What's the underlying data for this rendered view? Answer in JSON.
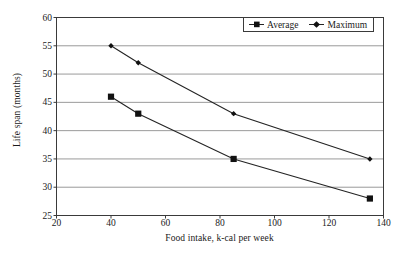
{
  "chart_data": {
    "type": "line",
    "title": "",
    "xlabel": "Food intake, k-cal per week",
    "ylabel": "Life span (months)",
    "xlim": [
      20,
      140
    ],
    "ylim": [
      25,
      60
    ],
    "xticks": [
      20,
      40,
      60,
      80,
      100,
      120,
      140
    ],
    "yticks": [
      25,
      30,
      35,
      40,
      45,
      50,
      55,
      60
    ],
    "grid": "horizontal",
    "legend_position": "top-right",
    "x": [
      40,
      50,
      85,
      135
    ],
    "series": [
      {
        "name": "Average",
        "marker": "square",
        "values": [
          46,
          43,
          35,
          28
        ]
      },
      {
        "name": "Maximum",
        "marker": "diamond",
        "values": [
          55,
          52,
          43,
          35
        ]
      }
    ]
  },
  "legend": {
    "entries": [
      {
        "label": "Average",
        "marker": "legend-marker-square"
      },
      {
        "label": "Maximum",
        "marker": "legend-marker-diamond"
      }
    ]
  },
  "colors": {
    "line": "#242424",
    "marker": "#111111",
    "grid": "#9a9a9a",
    "axis": "#3a3a3a",
    "background": "#ffffff",
    "text": "#1a1a1a"
  }
}
